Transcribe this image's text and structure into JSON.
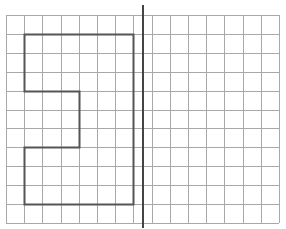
{
  "diagram": {
    "type": "grid-reflection",
    "background": "#ffffff",
    "grid": {
      "columns": 15,
      "rows": 11,
      "origin_x": 6,
      "origin_y": 15,
      "cell_width": 18.2,
      "cell_height": 18.9,
      "line_color": "#a8a8a8",
      "line_width": 1
    },
    "shape": {
      "stroke": "#555555",
      "stroke_width": 2,
      "fill": "#ffffff",
      "points_grid": [
        [
          1,
          1
        ],
        [
          7,
          1
        ],
        [
          7,
          10
        ],
        [
          1,
          10
        ],
        [
          1,
          7
        ],
        [
          4,
          7
        ],
        [
          4,
          4
        ],
        [
          1,
          4
        ]
      ]
    },
    "mirror_line": {
      "x": 143,
      "y1": 5,
      "y2": 228,
      "color": "#444444",
      "width": 2
    }
  }
}
